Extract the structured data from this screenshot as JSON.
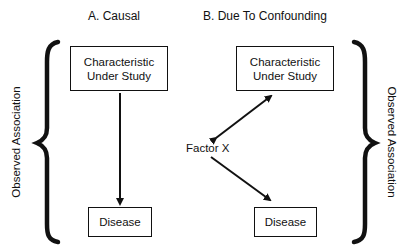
{
  "panels": {
    "causal": {
      "title": "A. Causal",
      "top_box": {
        "line1": "Characteristic",
        "line2": "Under Study"
      },
      "bottom_box": "Disease"
    },
    "confounding": {
      "title": "B.  Due To Confounding",
      "top_box": {
        "line1": "Characteristic",
        "line2": "Under Study"
      },
      "confounder": "Factor X",
      "bottom_box": "Disease"
    }
  },
  "braces": {
    "left_label": "Observed Association",
    "right_label": "Observed Association"
  },
  "colors": {
    "ink": "#111111",
    "background": "#ffffff"
  }
}
